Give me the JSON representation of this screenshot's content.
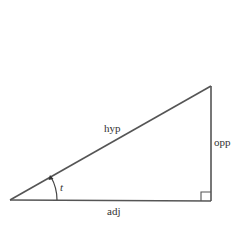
{
  "diagram": {
    "type": "right-triangle",
    "labels": {
      "hypotenuse": "hyp",
      "opposite": "opp",
      "adjacent": "adj",
      "angle": "t"
    },
    "vertices": {
      "angle_vertex": [
        10,
        200
      ],
      "right_angle_vertex": [
        211,
        201
      ],
      "top_vertex": [
        211,
        86
      ]
    },
    "colors": {
      "stroke": "#555555",
      "text": "#333333",
      "background": "#ffffff"
    }
  }
}
